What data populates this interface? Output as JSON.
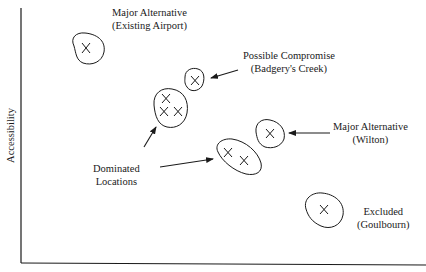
{
  "axes": {
    "y_label": "Accessibility",
    "x_label": ""
  },
  "colors": {
    "ink": "#1a1a1a",
    "background": "#ffffff"
  },
  "annotations": [
    {
      "id": "existing-airport",
      "line1": "Major Alternative",
      "line2": "(Existing Airport)"
    },
    {
      "id": "badgerys-creek",
      "line1": "Possible Compromise",
      "line2": "(Badgery's Creek)"
    },
    {
      "id": "wilton",
      "line1": "Major Alternative",
      "line2": "(Wilton)"
    },
    {
      "id": "dominated",
      "line1": "Dominated",
      "line2": "Locations"
    },
    {
      "id": "goulbourn",
      "line1": "Excluded",
      "line2": "(Goulbourn)"
    }
  ],
  "clusters": [
    {
      "name": "Existing Airport",
      "points": 1,
      "category": "Major Alternative"
    },
    {
      "name": "Badgery's Creek",
      "points": 1,
      "category": "Possible Compromise"
    },
    {
      "name": "Dominated cluster A",
      "points": 3,
      "category": "Dominated"
    },
    {
      "name": "Wilton",
      "points": 1,
      "category": "Major Alternative"
    },
    {
      "name": "Dominated cluster B",
      "points": 2,
      "category": "Dominated"
    },
    {
      "name": "Goulbourn",
      "points": 1,
      "category": "Excluded"
    }
  ],
  "marker_symbol": "X"
}
